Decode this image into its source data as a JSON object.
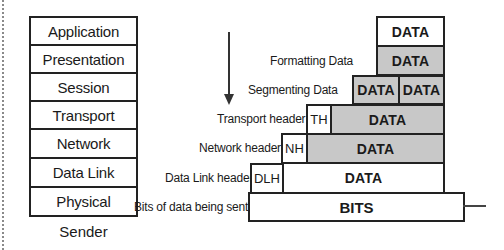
{
  "layers": [
    {
      "label": "Application"
    },
    {
      "label": "Presentation"
    },
    {
      "label": "Session"
    },
    {
      "label": "Transport"
    },
    {
      "label": "Network"
    },
    {
      "label": "Data Link"
    },
    {
      "label": "Physical"
    }
  ],
  "stack_caption": "Sender",
  "arrow": {
    "direction": "down",
    "icon": "arrow-down-icon"
  },
  "encapsulation": {
    "application": {
      "data": "DATA"
    },
    "presentation": {
      "annotation": "Formatting Data",
      "data": "DATA"
    },
    "session": {
      "annotation": "Segmenting Data",
      "segments": [
        "DATA",
        "DATA"
      ]
    },
    "transport": {
      "annotation": "Transport header",
      "header": "TH",
      "data": "DATA"
    },
    "network": {
      "annotation": "Network header",
      "header": "NH",
      "data": "DATA"
    },
    "data_link": {
      "annotation": "Data Link header",
      "header": "DLH",
      "data": "DATA"
    },
    "physical": {
      "annotation": "Bits of data being sent",
      "data": "BITS"
    }
  },
  "colors": {
    "stroke": "#222222",
    "fill_gray": "#c8c8c8",
    "fill_white": "#ffffff"
  }
}
